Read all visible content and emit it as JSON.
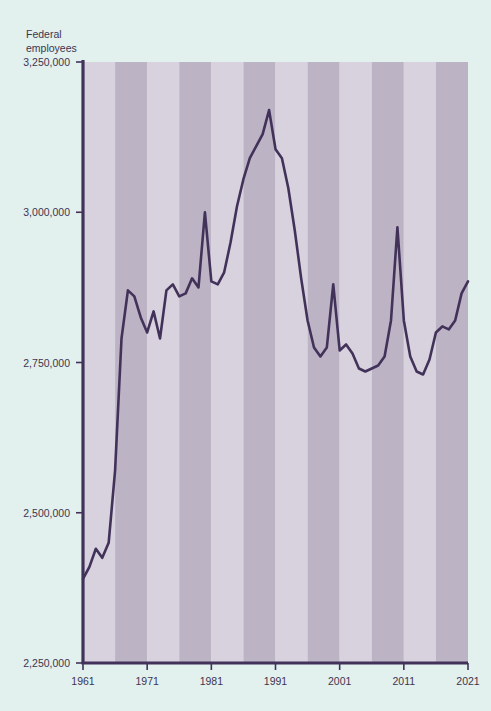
{
  "axis_title": "Federal\nemployees",
  "colors": {
    "background": "#e2f0ee",
    "band_light": "#d7d2de",
    "band_dark": "#bcb3c5",
    "line": "#42325a",
    "axis": "#42325a",
    "text": "#3d3550"
  },
  "bleed_through": {
    "top": "",
    "mid": "",
    "bottom": ""
  },
  "chart_data": {
    "type": "line",
    "title": "",
    "subtitle": "",
    "xlabel": "",
    "ylabel": "Federal employees",
    "ylim": [
      2250000,
      3250000
    ],
    "xlim": [
      1961,
      2021
    ],
    "grid": false,
    "legend": "none",
    "y_ticks": [
      2250000,
      2500000,
      2750000,
      3000000,
      3250000
    ],
    "y_tick_labels": [
      "2,250,000",
      "2,500,000",
      "2,750,000",
      "3,000,000",
      "3,250,000"
    ],
    "x_ticks": [
      1961,
      1971,
      1981,
      1991,
      2001,
      2011,
      2021
    ],
    "x_tick_labels": [
      "1961",
      "1971",
      "1981",
      "1991",
      "2001",
      "2011",
      "2021"
    ],
    "band_shading": {
      "description": "alternating vertical 5-year bands",
      "period_years": 5,
      "start_year": 1961
    },
    "series": [
      {
        "name": "Federal employees",
        "x": [
          1961,
          1962,
          1963,
          1964,
          1965,
          1966,
          1967,
          1968,
          1969,
          1970,
          1971,
          1972,
          1973,
          1974,
          1975,
          1976,
          1977,
          1978,
          1979,
          1980,
          1981,
          1982,
          1983,
          1984,
          1985,
          1986,
          1987,
          1988,
          1989,
          1990,
          1991,
          1992,
          1993,
          1994,
          1995,
          1996,
          1997,
          1998,
          1999,
          2000,
          2001,
          2002,
          2003,
          2004,
          2005,
          2006,
          2007,
          2008,
          2009,
          2010,
          2011,
          2012,
          2013,
          2014,
          2015,
          2016,
          2017,
          2018,
          2019,
          2020,
          2021
        ],
        "values": [
          2390000,
          2410000,
          2440000,
          2425000,
          2450000,
          2570000,
          2790000,
          2870000,
          2860000,
          2825000,
          2800000,
          2835000,
          2790000,
          2870000,
          2880000,
          2860000,
          2865000,
          2890000,
          2875000,
          3000000,
          2885000,
          2880000,
          2900000,
          2950000,
          3010000,
          3055000,
          3090000,
          3110000,
          3130000,
          3170000,
          3105000,
          3090000,
          3040000,
          2970000,
          2890000,
          2820000,
          2775000,
          2760000,
          2775000,
          2880000,
          2770000,
          2780000,
          2765000,
          2740000,
          2735000,
          2740000,
          2745000,
          2760000,
          2820000,
          2975000,
          2820000,
          2760000,
          2735000,
          2730000,
          2755000,
          2800000,
          2810000,
          2805000,
          2820000,
          2865000,
          2885000
        ],
        "color": "#42325a",
        "annotations": [
          {
            "year": 1980,
            "note": "census spike"
          },
          {
            "year": 1990,
            "note": "peak 3,170,000"
          },
          {
            "year": 2000,
            "note": "census spike"
          },
          {
            "year": 2010,
            "note": "census spike"
          }
        ]
      }
    ]
  }
}
